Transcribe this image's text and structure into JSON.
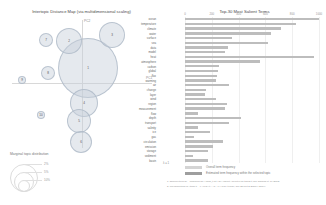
{
  "left": {
    "title": "Intertopic Distance Map (via multidimensional scaling)",
    "axes": {
      "x_label": "PC1",
      "y_label": "PC2"
    },
    "legend": {
      "title": "Marginal topic distribution",
      "values": [
        "2%",
        "5%",
        "10%"
      ]
    },
    "topics": [
      {
        "id": "1",
        "x": 76,
        "y": 48,
        "r": 30
      },
      {
        "id": "2",
        "x": 57,
        "y": 21,
        "r": 13
      },
      {
        "id": "3",
        "x": 100,
        "y": 15,
        "r": 13
      },
      {
        "id": "4",
        "x": 72,
        "y": 83,
        "r": 14
      },
      {
        "id": "5",
        "x": 67,
        "y": 101,
        "r": 12
      },
      {
        "id": "6",
        "x": 69,
        "y": 122,
        "r": 11
      },
      {
        "id": "7",
        "x": 34,
        "y": 20,
        "r": 7
      },
      {
        "id": "8",
        "x": 36,
        "y": 53,
        "r": 7
      },
      {
        "id": "9",
        "x": 10,
        "y": 60,
        "r": 4
      },
      {
        "id": "10",
        "x": 29,
        "y": 95,
        "r": 4
      }
    ]
  },
  "right": {
    "title": "Top-30 Most Salient Terms",
    "xticks": [
      "0",
      "200",
      "400",
      "600",
      "800",
      "1000"
    ],
    "xmax": 1000,
    "slider_label": "λ = 1",
    "legend": {
      "overall": "Overall term frequency",
      "estimated": "Estimated term frequency within the selected topic"
    },
    "footnotes": [
      "1. saliency(term w) = frequency(w) * [sum_t p(t | w) * log(p(t | w)/p(t))] for topics t; see Chuang et. al (2012)",
      "2. relevance(term w | topic t) = λ * p(w | t) + (1 - λ) * p(w | t)/p(w); see Sievert & Shirley (2014)"
    ],
    "terms": [
      {
        "label": "ocean",
        "total": 1000,
        "selected": 1000
      },
      {
        "label": "temperature",
        "total": 830,
        "selected": 830
      },
      {
        "label": "climate",
        "total": 720,
        "selected": 720
      },
      {
        "label": "water",
        "total": 640,
        "selected": 640
      },
      {
        "label": "surface",
        "total": 350,
        "selected": 350
      },
      {
        "label": "sea",
        "total": 620,
        "selected": 620
      },
      {
        "label": "data",
        "total": 320,
        "selected": 320
      },
      {
        "label": "model",
        "total": 300,
        "selected": 300
      },
      {
        "label": "heat",
        "total": 960,
        "selected": 960
      },
      {
        "label": "atmosphere",
        "total": 560,
        "selected": 560
      },
      {
        "label": "carbon",
        "total": 250,
        "selected": 250
      },
      {
        "label": "global",
        "total": 245,
        "selected": 245
      },
      {
        "label": "flux",
        "total": 240,
        "selected": 240
      },
      {
        "label": "warming",
        "total": 235,
        "selected": 235
      },
      {
        "label": "air",
        "total": 330,
        "selected": 330
      },
      {
        "label": "change",
        "total": 160,
        "selected": 160
      },
      {
        "label": "layer",
        "total": 150,
        "selected": 150
      },
      {
        "label": "wind",
        "total": 230,
        "selected": 230
      },
      {
        "label": "region",
        "total": 310,
        "selected": 310
      },
      {
        "label": "measurement",
        "total": 300,
        "selected": 300
      },
      {
        "label": "flow",
        "total": 100,
        "selected": 100
      },
      {
        "label": "depth",
        "total": 420,
        "selected": 420
      },
      {
        "label": "transport",
        "total": 330,
        "selected": 330
      },
      {
        "label": "salinity",
        "total": 95,
        "selected": 95
      },
      {
        "label": "ice",
        "total": 190,
        "selected": 190
      },
      {
        "label": "gas",
        "total": 65,
        "selected": 65
      },
      {
        "label": "circulation",
        "total": 285,
        "selected": 285
      },
      {
        "label": "emission",
        "total": 210,
        "selected": 210
      },
      {
        "label": "storage",
        "total": 175,
        "selected": 175
      },
      {
        "label": "sediment",
        "total": 60,
        "selected": 60
      },
      {
        "label": "basin",
        "total": 170,
        "selected": 170
      }
    ]
  }
}
